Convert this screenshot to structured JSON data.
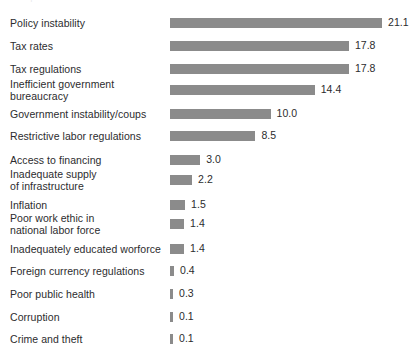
{
  "header": {
    "clipped_fragment": "Most problematic factors"
  },
  "style": {
    "bar_color": "#8b8b8b",
    "text_color": "#2c2c2e",
    "background": "#ffffff"
  },
  "chart_data": {
    "type": "bar",
    "orientation": "horizontal",
    "title": "",
    "subtitle": "",
    "xlabel": "",
    "ylabel": "",
    "grid": false,
    "legend": false,
    "axis_line": false,
    "tick_labels": [],
    "xlim": [
      0,
      21.1
    ],
    "value_format": "one-decimal",
    "categories": [
      "Policy instability",
      "Tax rates",
      "Tax regulations",
      "Inefficient government\nbureaucracy",
      "Government instability/coups",
      "Restrictive labor regulations",
      "Access to financing",
      "Inadequate supply\nof infrastructure",
      "Inflation",
      "Poor work ethic in\nnational labor force",
      "Inadequately educated worforce",
      "Foreign currency regulations",
      "Poor public health",
      "Corruption",
      "Crime and theft"
    ],
    "values": [
      21.1,
      17.8,
      17.8,
      14.4,
      10.0,
      8.5,
      3.0,
      2.2,
      1.5,
      1.4,
      1.4,
      0.4,
      0.3,
      0.1,
      0.1
    ],
    "value_labels": [
      "21.1",
      "17.8",
      "17.8",
      "14.4",
      "10.0",
      "8.5",
      "3.0",
      "2.2",
      "1.5",
      "1.4",
      "1.4",
      "0.4",
      "0.3",
      "0.1",
      "0.1"
    ],
    "rows": [
      {
        "label": "Policy instability",
        "value": 21.1,
        "value_label": "21.1",
        "lines": 1,
        "y": 13
      },
      {
        "label": "Tax rates",
        "value": 17.8,
        "value_label": "17.8",
        "lines": 1,
        "y": 36
      },
      {
        "label": "Tax regulations",
        "value": 17.8,
        "value_label": "17.8",
        "lines": 1,
        "y": 59
      },
      {
        "label": "Inefficient government\nbureaucracy",
        "value": 14.4,
        "value_label": "14.4",
        "lines": 2,
        "y": 80
      },
      {
        "label": "Government instability/coups",
        "value": 10.0,
        "value_label": "10.0",
        "lines": 1,
        "y": 104
      },
      {
        "label": "Restrictive labor regulations",
        "value": 8.5,
        "value_label": "8.5",
        "lines": 1,
        "y": 126
      },
      {
        "label": "Access to financing",
        "value": 3.0,
        "value_label": "3.0",
        "lines": 1,
        "y": 150
      },
      {
        "label": "Inadequate supply\nof infrastructure",
        "value": 2.2,
        "value_label": "2.2",
        "lines": 2,
        "y": 170
      },
      {
        "label": "Inflation",
        "value": 1.5,
        "value_label": "1.5",
        "lines": 1,
        "y": 195
      },
      {
        "label": "Poor work ethic in\nnational labor force",
        "value": 1.4,
        "value_label": "1.4",
        "lines": 2,
        "y": 214
      },
      {
        "label": "Inadequately educated worforce",
        "value": 1.4,
        "value_label": "1.4",
        "lines": 1,
        "y": 239
      },
      {
        "label": "Foreign currency regulations",
        "value": 0.4,
        "value_label": "0.4",
        "lines": 1,
        "y": 261
      },
      {
        "label": "Poor public health",
        "value": 0.3,
        "value_label": "0.3",
        "lines": 1,
        "y": 284
      },
      {
        "label": "Corruption",
        "value": 0.1,
        "value_label": "0.1",
        "lines": 1,
        "y": 307
      },
      {
        "label": "Crime and theft",
        "value": 0.1,
        "value_label": "0.1",
        "lines": 1,
        "y": 329
      }
    ]
  },
  "layout": {
    "bar_origin_x": 170,
    "px_per_unit": 10.05,
    "min_bar_px": 3,
    "value_gap_px": 6
  }
}
